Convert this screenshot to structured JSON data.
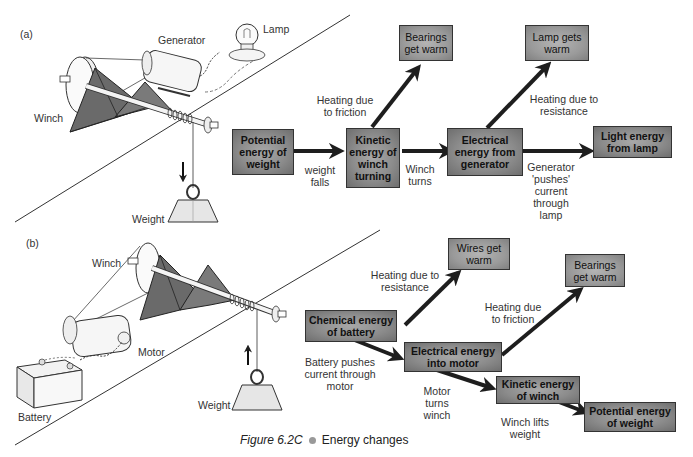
{
  "figure": {
    "caption_label": "Figure 6.2C",
    "caption_text": "Energy changes"
  },
  "part_a": {
    "tag": "(a)",
    "illustration_labels": {
      "generator": "Generator",
      "lamp": "Lamp",
      "winch": "Winch",
      "weight": "Weight"
    },
    "boxes": {
      "potential": "Potential energy of weight",
      "kinetic": "Kinetic energy of winch turning",
      "bearings": "Bearings get warm",
      "electrical": "Electrical energy from generator",
      "lamp_warm": "Lamp gets warm",
      "light": "Light energy from lamp"
    },
    "arrow_labels": {
      "weight_falls": "weight falls",
      "friction": "Heating due to friction",
      "winch_turns": "Winch turns",
      "resistance": "Heating due to resistance",
      "generator_pushes": "Generator 'pushes' current through lamp"
    }
  },
  "part_b": {
    "tag": "(b)",
    "illustration_labels": {
      "winch": "Winch",
      "motor": "Motor",
      "battery": "Battery",
      "weight": "Weight"
    },
    "boxes": {
      "chemical": "Chemical energy of battery",
      "wires": "Wires get warm",
      "electrical": "Electrical energy into motor",
      "bearings": "Bearings get warm",
      "kinetic": "Kinetic energy of winch",
      "potential": "Potential energy of weight"
    },
    "arrow_labels": {
      "resistance": "Heating due to resistance",
      "friction": "Heating due to friction",
      "battery_pushes": "Battery pushes current through motor",
      "motor_turns": "Motor turns winch",
      "winch_lifts": "Winch lifts weight"
    }
  },
  "colors": {
    "box_fill": "#8c8c8c",
    "box_border": "#333333",
    "arrow": "#2a2a2a",
    "trapezoid": "#6a6a6a",
    "text": "#333333"
  }
}
